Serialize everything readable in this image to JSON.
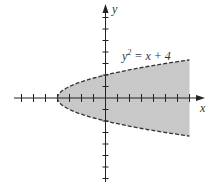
{
  "chart_data": {
    "type": "area",
    "title": "",
    "equation_label": "y² = x + 4",
    "xlabel": "x",
    "ylabel": "y",
    "region": "x ≥ y² − 4 (interior of parabola, dashed boundary), shaded to x = 7",
    "boundary_style": "dashed",
    "xlim": [
      -8,
      8
    ],
    "ylim": [
      -7,
      7
    ],
    "x_ticks": [
      -7,
      -6,
      -5,
      -4,
      -3,
      -2,
      -1,
      1,
      2,
      3,
      4,
      5,
      6,
      7
    ],
    "y_ticks": [
      -7,
      -6,
      -5,
      -4,
      -3,
      -2,
      -1,
      1,
      2,
      3,
      4,
      5,
      6,
      7
    ],
    "vertex": [
      -4,
      0
    ],
    "y_intercepts": [
      2,
      -2
    ],
    "shade_right_edge_x": 7,
    "grid": false,
    "colors": {
      "fill": "#c8c8c8",
      "axis": "#222222",
      "curve": "#333333"
    }
  },
  "labels": {
    "x": "x",
    "y": "y",
    "eq_base": "y",
    "eq_sup": "2",
    "eq_rest": " = x + 4"
  }
}
